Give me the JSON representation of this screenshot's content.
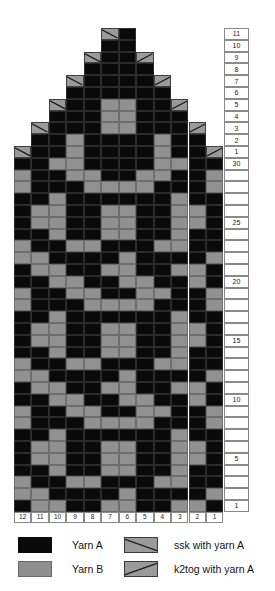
{
  "chart_data": {
    "type": "heatmap",
    "xlabel": "",
    "ylabel": "",
    "columns": 12,
    "rows": 41,
    "column_labels": [
      "12",
      "11",
      "10",
      "9",
      "8",
      "7",
      "6",
      "5",
      "4",
      "3",
      "2",
      "1"
    ],
    "row_labels_bottom_to_top": [
      "1",
      "2",
      "3",
      "4",
      "5",
      "6",
      "7",
      "8",
      "9",
      "10",
      "11",
      "12",
      "13",
      "14",
      "15",
      "16",
      "17",
      "18",
      "19",
      "20",
      "21",
      "22",
      "23",
      "24",
      "25",
      "26",
      "27",
      "28",
      "29",
      "30",
      "1",
      "2",
      "3",
      "4",
      "5",
      "6",
      "7",
      "8",
      "9",
      "10",
      "11"
    ],
    "row_labels_shown": [
      "1",
      "5",
      "10",
      "15",
      "20",
      "25",
      "30",
      "1",
      "2",
      "3",
      "4",
      "5",
      "6",
      "7",
      "8",
      "9",
      "10",
      "11"
    ],
    "legend_position": "bottom",
    "grid": true,
    "symbols": {
      "A": "Yarn A",
      "B": "Yarn B",
      "S": "ssk with yarn A",
      "K": "k2tog with yarn A",
      "_": "no stitch"
    },
    "cells_top_to_bottom": [
      "_____SA_____",
      "_____AA_____",
      "____SAAK____",
      "____AAAA____",
      "___SAAAAK___",
      "___AAAAAA___",
      "__SAABBAAK__",
      "__AAABBAAA__",
      "_SAAABBAAAK_",
      "_AABAAAABAA_",
      "SAABAAAABAAK",
      "AABBAAAABBAA",
      "BAABBAABBAAB",
      "BAAABBBBAAAB",
      "AABAAAAAABAA",
      "ABBAABBAABBA",
      "ABBAABBAABBA",
      "AABAABBAABAA",
      "BAABBAAABBAA",
      "BBAAAABAAAAB",
      "ABBAABBAABBA",
      "AABBAABBAABA",
      "BAABBAABBAAB",
      "BAAABBBBAAAB",
      "AABAAAAAABAA",
      "ABBAABBAABBA",
      "ABBAABBAABBA",
      "AABAABBAABAA",
      "BAABBAAABBAA",
      "BBAAAABAAAAB",
      "ABBAABBAABBA",
      "AABBAABBAABA",
      "BAABBAABBAAB",
      "BAAABBBBAAAB",
      "AABAAAAAABAA",
      "ABBAABBAABBA",
      "ABBAABBAABBA",
      "AABAABBAABAA",
      "BAABBAAABBAA",
      "BBAAAABAAAAB",
      "ABBAABBAABBA"
    ]
  },
  "legend": {
    "items": [
      {
        "key": "yarn-a",
        "symbol": "A",
        "label": "Yarn A",
        "color": "#0a0a0a"
      },
      {
        "key": "yarn-b",
        "symbol": "B",
        "label": "Yarn B",
        "color": "#8e8e8e"
      },
      {
        "key": "ssk",
        "symbol": "S",
        "label": "ssk with yarn A",
        "color": "#9a9a9a"
      },
      {
        "key": "k2tog",
        "symbol": "K",
        "label": "k2tog with yarn A",
        "color": "#9a9a9a"
      }
    ]
  },
  "colors": {
    "yarn_a": "#0a0a0a",
    "yarn_b": "#8e8e8e",
    "decrease_fill": "#9a9a9a",
    "grid_line": "#8a8a8a",
    "background": "#ffffff",
    "text": "#141414"
  }
}
